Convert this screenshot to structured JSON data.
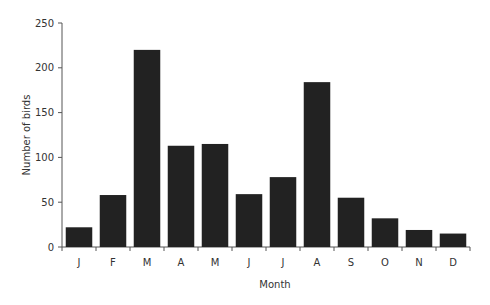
{
  "chart_data": {
    "type": "bar",
    "title": "",
    "xlabel": "Month",
    "ylabel": "Number of birds",
    "categories": [
      "J",
      "F",
      "M",
      "A",
      "M",
      "J",
      "J",
      "A",
      "S",
      "O",
      "N",
      "D"
    ],
    "values": [
      22,
      58,
      220,
      113,
      115,
      59,
      78,
      184,
      55,
      32,
      19,
      15
    ],
    "ylim": [
      0,
      250
    ],
    "yticks": [
      0,
      50,
      100,
      150,
      200,
      250
    ],
    "grid": false,
    "legend": null,
    "bar_color": "#222222"
  }
}
